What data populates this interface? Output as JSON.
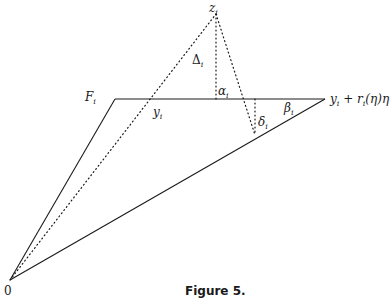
{
  "figure": {
    "caption": "Figure 5.",
    "labels": {
      "z": {
        "base": "z",
        "sub": "i"
      },
      "Delta": {
        "base": "Δ",
        "sub": "i"
      },
      "F": {
        "base": "F",
        "sub": "i"
      },
      "alpha": {
        "base": "α",
        "sub": "i"
      },
      "y": {
        "base": "y",
        "sub": "i"
      },
      "beta": {
        "base": "β",
        "sub": "i"
      },
      "delta": {
        "base": "δ",
        "sub": "i"
      },
      "endpoint": {
        "base": "y",
        "sub": "i",
        "rest": " + r",
        "sub2": "i",
        "rest2": "(η)η"
      },
      "origin": "0"
    },
    "points": {
      "origin": [
        10,
        280
      ],
      "F_corner": [
        115,
        99
      ],
      "top_end": [
        325,
        99
      ],
      "z": [
        216,
        14
      ],
      "alpha_foot": [
        216,
        99
      ],
      "delta_top": [
        255,
        99
      ],
      "delta_bottom": [
        255,
        135
      ]
    }
  }
}
